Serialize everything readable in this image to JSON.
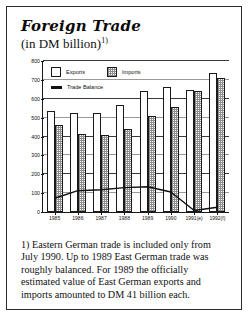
{
  "card": {
    "title": "Foreign Trade",
    "subtitle_text": "(in DM billion)",
    "subtitle_superscript": "1)"
  },
  "legend": {
    "exports_label": "Exports",
    "imports_label": "Imports",
    "balance_label": "Trade Balance"
  },
  "footnote": {
    "text": "1)  Eastern German trade is included only from July 1990. Up to 1989 East German trade was roughly balanced. For 1989 the officially estimated value of East German exports and imports amounted to DM 41 billion each."
  },
  "chart_data": {
    "type": "bar",
    "title": "Foreign Trade",
    "subtitle": "(in DM billion)",
    "xlabel": "",
    "ylabel": "",
    "ylim": [
      0,
      800
    ],
    "ytick_step": 100,
    "yticks": [
      "0",
      "100",
      "200",
      "300",
      "400",
      "500",
      "600",
      "700",
      "800"
    ],
    "grid": true,
    "legend_position": "top-left",
    "categories": [
      "1985",
      "1986",
      "1987",
      "1988",
      "1989",
      "1990",
      "1991(e)",
      "1992(f)"
    ],
    "series": [
      {
        "name": "Exports",
        "type": "bar",
        "values": [
          537,
          526,
          527,
          567,
          641,
          662,
          648,
          735
        ]
      },
      {
        "name": "Imports",
        "type": "bar",
        "values": [
          463,
          413,
          409,
          438,
          507,
          556,
          640,
          710
        ]
      },
      {
        "name": "Trade Balance",
        "type": "line",
        "values": [
          73,
          113,
          118,
          129,
          134,
          106,
          8,
          25
        ]
      }
    ],
    "colors": {
      "exports": "#ffffff",
      "imports": "#8d8d8d",
      "balance": "#101010",
      "axis": "#1a1a1a",
      "grid": "#9a9a9a"
    }
  }
}
